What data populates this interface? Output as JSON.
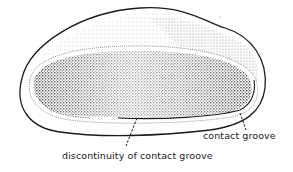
{
  "figure": {
    "colors": {
      "outline": "#1a1a1a",
      "stipple": "#333333",
      "background": "#ffffff"
    }
  },
  "labels": {
    "contact_groove": "contact groove",
    "discontinuity": "discontinuity of contact groove"
  }
}
